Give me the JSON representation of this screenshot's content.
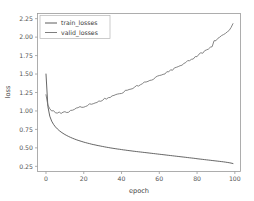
{
  "chart_data": {
    "type": "line",
    "title": "",
    "xlabel": "epoch",
    "ylabel": "loss",
    "xlim": [
      -4.5,
      103
    ],
    "ylim": [
      0.18,
      2.32
    ],
    "xticks": [
      0,
      20,
      40,
      60,
      80,
      100
    ],
    "xtick_labels": [
      "0",
      "20",
      "40",
      "60",
      "80",
      "100"
    ],
    "yticks": [
      0.25,
      0.5,
      0.75,
      1.0,
      1.25,
      1.5,
      1.75,
      2.0,
      2.25
    ],
    "ytick_labels": [
      "0.25",
      "0.50",
      "0.75",
      "1.00",
      "1.25",
      "1.50",
      "1.75",
      "2.00",
      "2.25"
    ],
    "grid": false,
    "legend_position": "upper left",
    "line_color": "#4a4a4a",
    "axis_color": "#9a9a9a",
    "background": "#ffffff",
    "x": [
      0,
      1,
      2,
      3,
      4,
      5,
      6,
      7,
      8,
      9,
      10,
      11,
      12,
      13,
      14,
      15,
      16,
      17,
      18,
      19,
      20,
      21,
      22,
      23,
      24,
      25,
      26,
      27,
      28,
      29,
      30,
      31,
      32,
      33,
      34,
      35,
      36,
      37,
      38,
      39,
      40,
      41,
      42,
      43,
      44,
      45,
      46,
      47,
      48,
      49,
      50,
      51,
      52,
      53,
      54,
      55,
      56,
      57,
      58,
      59,
      60,
      61,
      62,
      63,
      64,
      65,
      66,
      67,
      68,
      69,
      70,
      71,
      72,
      73,
      74,
      75,
      76,
      77,
      78,
      79,
      80,
      81,
      82,
      83,
      84,
      85,
      86,
      87,
      88,
      89,
      90,
      91,
      92,
      93,
      94,
      95,
      96,
      97,
      98,
      99
    ],
    "series": [
      {
        "name": "train_losses",
        "label": "train_losses",
        "color": "#4a4a4a",
        "values": [
          1.5,
          1.06,
          0.93,
          0.862,
          0.818,
          0.784,
          0.757,
          0.734,
          0.714,
          0.697,
          0.681,
          0.667,
          0.654,
          0.642,
          0.631,
          0.621,
          0.611,
          0.602,
          0.594,
          0.586,
          0.578,
          0.571,
          0.564,
          0.558,
          0.551,
          0.545,
          0.54,
          0.534,
          0.529,
          0.524,
          0.519,
          0.514,
          0.509,
          0.505,
          0.5,
          0.496,
          0.492,
          0.488,
          0.484,
          0.481,
          0.477,
          0.473,
          0.47,
          0.466,
          0.463,
          0.46,
          0.456,
          0.453,
          0.45,
          0.447,
          0.444,
          0.441,
          0.438,
          0.435,
          0.432,
          0.429,
          0.426,
          0.423,
          0.42,
          0.417,
          0.414,
          0.411,
          0.408,
          0.405,
          0.402,
          0.399,
          0.396,
          0.393,
          0.39,
          0.387,
          0.384,
          0.381,
          0.378,
          0.375,
          0.372,
          0.369,
          0.366,
          0.363,
          0.36,
          0.357,
          0.353,
          0.35,
          0.347,
          0.344,
          0.341,
          0.338,
          0.335,
          0.332,
          0.329,
          0.326,
          0.323,
          0.32,
          0.317,
          0.314,
          0.311,
          0.307,
          0.303,
          0.299,
          0.294,
          0.288
        ]
      },
      {
        "name": "valid_losses",
        "label": "valid_losses",
        "color": "#6f6f6f",
        "values": [
          1.22,
          1.08,
          1.03,
          1.01,
          0.995,
          0.985,
          0.978,
          0.975,
          0.972,
          0.975,
          0.98,
          0.988,
          0.995,
          1.005,
          1.015,
          1.022,
          1.03,
          1.04,
          1.048,
          1.055,
          1.062,
          1.072,
          1.08,
          1.088,
          1.098,
          1.105,
          1.115,
          1.122,
          1.132,
          1.14,
          1.15,
          1.162,
          1.17,
          1.18,
          1.19,
          1.198,
          1.21,
          1.218,
          1.228,
          1.238,
          1.248,
          1.258,
          1.27,
          1.28,
          1.29,
          1.3,
          1.312,
          1.322,
          1.335,
          1.345,
          1.358,
          1.365,
          1.38,
          1.39,
          1.4,
          1.412,
          1.425,
          1.435,
          1.448,
          1.46,
          1.472,
          1.485,
          1.495,
          1.51,
          1.52,
          1.535,
          1.548,
          1.56,
          1.575,
          1.588,
          1.6,
          1.615,
          1.628,
          1.642,
          1.658,
          1.67,
          1.685,
          1.7,
          1.715,
          1.73,
          1.745,
          1.762,
          1.778,
          1.792,
          1.81,
          1.825,
          1.84,
          1.858,
          1.875,
          1.95,
          1.962,
          1.978,
          1.995,
          2.015,
          2.032,
          2.052,
          2.072,
          2.095,
          2.125,
          2.18
        ]
      }
    ],
    "noise_amplitude": 0.012
  },
  "legend": {
    "items": [
      {
        "label": "train_losses"
      },
      {
        "label": "valid_losses"
      }
    ]
  }
}
